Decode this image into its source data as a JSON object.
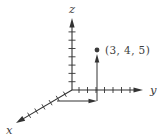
{
  "figure": {
    "type": "3d-coordinate-axes",
    "axes": {
      "x_label": "x",
      "y_label": "y",
      "z_label": "z"
    },
    "ticks": {
      "z_count": 7,
      "y_count": 7,
      "x_count": 6
    },
    "point": {
      "label": "(3, 4, 5)",
      "x": 3,
      "y": 4,
      "z": 5
    },
    "colors": {
      "stroke": "#333333",
      "text": "#3d3d3d",
      "point": "#3a3a3a",
      "background": "#ffffff"
    }
  }
}
